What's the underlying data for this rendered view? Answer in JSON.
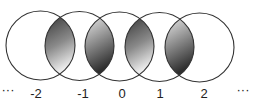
{
  "diagram": {
    "type": "overlapping-circles-chain",
    "stroke_color": "#333333",
    "gradient_dark": "#3a3a3a",
    "gradient_light": "#e6e6e6",
    "circles": [
      {
        "cx": 40.5,
        "cy": 45.5,
        "r": 34.5
      },
      {
        "cx": 79.5,
        "cy": 46,
        "r": 34.5
      },
      {
        "cx": 119.5,
        "cy": 46.5,
        "r": 34.5
      },
      {
        "cx": 159.5,
        "cy": 47,
        "r": 34.5
      },
      {
        "cx": 199.5,
        "cy": 47.5,
        "r": 34.5
      }
    ],
    "lenses": [
      {
        "gradient": "dark-top"
      },
      {
        "gradient": "light-top"
      },
      {
        "gradient": "dark-top"
      },
      {
        "gradient": "light-top"
      }
    ],
    "labels": [
      {
        "text": "···",
        "x": 8
      },
      {
        "text": "-2",
        "x": 36
      },
      {
        "text": "-1",
        "x": 83
      },
      {
        "text": "0",
        "x": 122
      },
      {
        "text": "1",
        "x": 160
      },
      {
        "text": "2",
        "x": 204
      },
      {
        "text": "···",
        "x": 243
      }
    ]
  }
}
